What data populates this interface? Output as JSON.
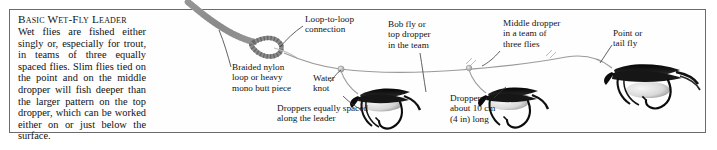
{
  "panel": {
    "title": "Basic Wet-Fly Leader",
    "body": "Wet flies are fished either singly or, especially for trout, in teams of three equally spaced flies. Slim flies tied on the point and on the middle dropper will fish deeper than the larger pattern on the top dropper, which can be worked either on or just below the surface."
  },
  "labels": {
    "loop_to_loop": "Loop-to-loop\nconnection",
    "braided_nylon": "Braided nylon\nloop or heavy\nmono butt piece",
    "water_knot": "Water\nknot",
    "bob_fly": "Bob fly or\ntop dropper\nin the team",
    "middle_dropper": "Middle dropper\nin a team of\nthree flies",
    "point_fly": "Point or\ntail fly",
    "dropper_spacing": "Droppers equally spaced\nalong the leader",
    "dropper_length": "Droppers\nabout 10 cm\n(4 in) long"
  },
  "colors": {
    "border": "#6b6b6b",
    "text": "#131313",
    "leader": "#9a9a9a",
    "fly_dark": "#111111",
    "background": "#ffffff"
  }
}
